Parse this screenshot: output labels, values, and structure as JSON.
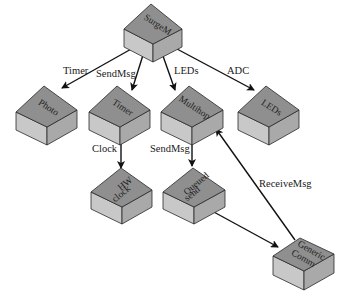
{
  "diagram": {
    "colors": {
      "top_face": "#8f8f8f",
      "left_face": "#c8c8c8",
      "right_face": "#a9a9a9",
      "edge": "#2a2a2a",
      "arrow": "#111111",
      "background": "#ffffff"
    },
    "nodes": [
      {
        "id": "surgem",
        "label_lines": [
          "SurgeM"
        ]
      },
      {
        "id": "photo",
        "label_lines": [
          "Photo"
        ]
      },
      {
        "id": "timer",
        "label_lines": [
          "Timer"
        ]
      },
      {
        "id": "multihop",
        "label_lines": [
          "Multihop"
        ]
      },
      {
        "id": "leds",
        "label_lines": [
          "LEDs"
        ]
      },
      {
        "id": "hwclock",
        "label_lines": [
          "HW",
          "clock"
        ]
      },
      {
        "id": "queuedsend",
        "label_lines": [
          "Queued",
          "send"
        ]
      },
      {
        "id": "genericcomm",
        "label_lines": [
          "Generic",
          "Comm"
        ]
      }
    ],
    "edges": [
      {
        "from": "surgem",
        "to": "photo",
        "label": "Timer"
      },
      {
        "from": "surgem",
        "to": "timer",
        "label": "SendMsg"
      },
      {
        "from": "surgem",
        "to": "multihop",
        "label": "LEDs"
      },
      {
        "from": "surgem",
        "to": "leds",
        "label": "ADC"
      },
      {
        "from": "timer",
        "to": "hwclock",
        "label": "Clock"
      },
      {
        "from": "multihop",
        "to": "queuedsend",
        "label": "SendMsg"
      },
      {
        "from": "queuedsend",
        "to": "genericcomm",
        "label": ""
      },
      {
        "from": "genericcomm",
        "to": "multihop",
        "label": "ReceiveMsg"
      }
    ]
  }
}
